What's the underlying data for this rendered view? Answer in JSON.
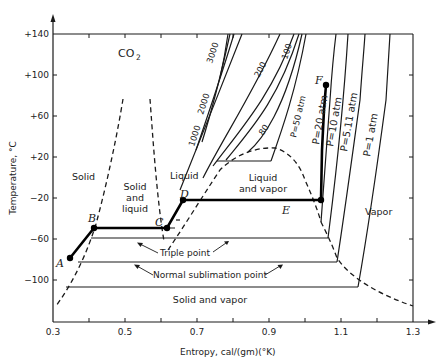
{
  "diagram": {
    "title_base": "CO",
    "title_sub": "2",
    "type": "temperature-entropy phase diagram",
    "x_axis": {
      "label": "Entropy,  cal/(gm)(°K)",
      "ticks": [
        "0.3",
        "0.5",
        "0.7",
        "0.9",
        "1.1",
        "1.3"
      ],
      "range": [
        0.3,
        1.35
      ]
    },
    "y_axis": {
      "label": "Temperature, °C",
      "ticks": [
        "+140",
        "+100",
        "+60",
        "+20",
        "−20",
        "−60",
        "−100"
      ],
      "range": [
        -130,
        140
      ]
    },
    "regions": {
      "solid": "Solid",
      "solid_liquid_1": "Solid",
      "solid_liquid_2": "and",
      "solid_liquid_3": "liquid",
      "liquid": "Liquid",
      "liquid_vapor_1": "Liquid",
      "liquid_vapor_2": "and vapor",
      "vapor": "Vapor",
      "solid_vapor": "Solid and vapor"
    },
    "points": {
      "A": "A",
      "B": "B",
      "C": "C",
      "D": "D",
      "E": "E",
      "F": "F"
    },
    "annotations": {
      "triple_point": "Triple point",
      "normal_sublimation_point": "Normal sublimation point"
    },
    "isobars": [
      {
        "label": "3000"
      },
      {
        "label": "2000"
      },
      {
        "label": "1000"
      },
      {
        "label": "200"
      },
      {
        "label": "100"
      },
      {
        "label": "80"
      },
      {
        "label": "P=50 atm"
      },
      {
        "label": "P=20 atm"
      },
      {
        "label": "P=10 atm"
      },
      {
        "label": "P=5.11 atm"
      },
      {
        "label": "P=1 atm"
      }
    ],
    "colors": {
      "ink": "#1a1a1a",
      "background": "#ffffff"
    }
  }
}
